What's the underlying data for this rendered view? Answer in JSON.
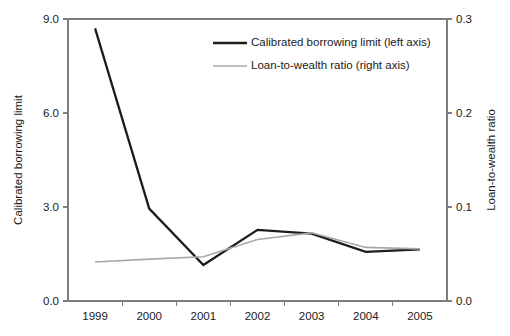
{
  "chart_data": {
    "type": "line",
    "title": "",
    "subtitle": "",
    "xlabel": "",
    "categories": [
      "1999",
      "2000",
      "2001",
      "2002",
      "2003",
      "2004",
      "2005"
    ],
    "grid": false,
    "legend_position": "top-right",
    "axes": {
      "left": {
        "label": "Calibrated borrowing limit",
        "ticks": [
          "0.0",
          "3.0",
          "6.0",
          "9.0"
        ],
        "tick_values": [
          0.0,
          3.0,
          6.0,
          9.0
        ],
        "lim": [
          0.0,
          9.0
        ]
      },
      "right": {
        "label": "Loan-to-wealth ratio",
        "ticks": [
          "0.0",
          "0.1",
          "0.2",
          "0.3"
        ],
        "tick_values": [
          0.0,
          0.1,
          0.2,
          0.3
        ],
        "lim": [
          0.0,
          0.3
        ]
      }
    },
    "series": [
      {
        "name": "Calibrated borrowing limit (left axis)",
        "axis": "left",
        "color": "#1c1c1c",
        "values": [
          8.7,
          2.95,
          1.15,
          2.27,
          2.15,
          1.57,
          1.65
        ]
      },
      {
        "name": "Loan-to-wealth ratio (right axis)",
        "axis": "right",
        "color": "#a8a8a8",
        "values": [
          0.0415,
          0.0445,
          0.047,
          0.0655,
          0.0725,
          0.057,
          0.0555
        ]
      }
    ]
  },
  "legend": {
    "entries": [
      {
        "label": "Calibrated borrowing limit (left axis)",
        "color": "#1c1c1c"
      },
      {
        "label": "Loan-to-wealth ratio (right axis)",
        "color": "#a8a8a8"
      }
    ]
  }
}
